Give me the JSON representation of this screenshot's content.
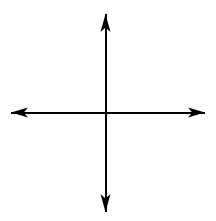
{
  "figure": {
    "type": "coordinate-axes-diagram",
    "background_color": "#ffffff",
    "stroke_color": "#000000",
    "canvas": {
      "width": 216,
      "height": 221
    },
    "origin": {
      "x": 105.5,
      "y": 112.5
    },
    "labels": {
      "x_axis": "",
      "y_axis": "",
      "origin": "",
      "title": ""
    },
    "axes": [
      {
        "name": "vertical-axis",
        "orientation": "vertical",
        "stroke_width": 2,
        "x": 105.5,
        "y_start": 14,
        "y_end": 212,
        "arrowheads": [
          "top",
          "bottom"
        ]
      },
      {
        "name": "horizontal-axis",
        "orientation": "horizontal",
        "stroke_width": 2,
        "y": 112.5,
        "x_start": 11,
        "x_end": 205,
        "arrowheads": [
          "left",
          "right"
        ]
      }
    ],
    "arrowheads": [
      {
        "name": "arrow-up",
        "direction": "up",
        "tip": {
          "x": 105.5,
          "y": 14
        },
        "length": 18,
        "width": 10
      },
      {
        "name": "arrow-down",
        "direction": "down",
        "tip": {
          "x": 105.5,
          "y": 212
        },
        "length": 18,
        "width": 10
      },
      {
        "name": "arrow-left",
        "direction": "left",
        "tip": {
          "x": 11,
          "y": 112.5
        },
        "length": 17,
        "width": 10
      },
      {
        "name": "arrow-right",
        "direction": "right",
        "tip": {
          "x": 205,
          "y": 112.5
        },
        "length": 17,
        "width": 10
      }
    ],
    "gridlines": false,
    "tick_marks": false,
    "tick_labels": [],
    "data_series": [],
    "quadrants": [
      "I",
      "II",
      "III",
      "IV"
    ]
  },
  "chart_data": {
    "type": "scatter",
    "title": "",
    "subtitle": "",
    "xlabel": "",
    "ylabel": "",
    "x": [],
    "y": [],
    "series": [],
    "xlim": [
      -1,
      1
    ],
    "ylim": [
      -1,
      1
    ],
    "xticks": [],
    "yticks": [],
    "xticklabels": [],
    "yticklabels": [],
    "grid": false,
    "legend": false,
    "legend_position": "none",
    "annotations": [],
    "note": "Empty Cartesian coordinate plane: two perpendicular double-headed axes crossing at the origin, no plotted data, no tick marks, no labels."
  }
}
